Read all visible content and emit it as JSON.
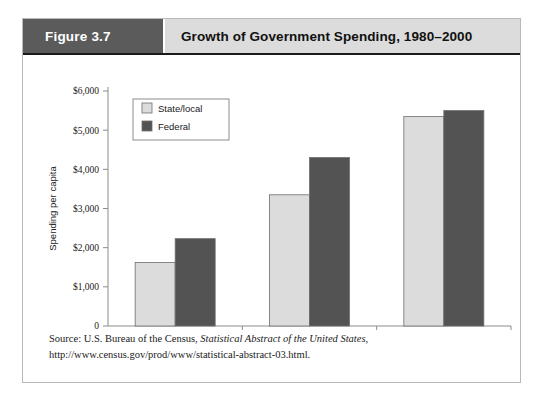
{
  "figure": {
    "badge": "Figure 3.7",
    "title": "Growth of Government Spending, 1980–2000"
  },
  "source": {
    "prefix": "Source: U.S. Bureau of the Census, ",
    "italic": "Statistical Abstract of the United States",
    "suffix": ", http://www.census.gov/prod/www/statistical-abstract-03.html."
  },
  "colors": {
    "state_local": "#dcdcdc",
    "federal": "#535353",
    "badge_bg": "#5b5b5b",
    "title_bg": "#dcdcdc",
    "axis": "#8c8c8c",
    "bar_outline": "#6e6e6e",
    "frame": "#b9b9b9"
  },
  "chart_data": {
    "type": "bar",
    "title": "Growth of Government Spending, 1980–2000",
    "xlabel": "",
    "ylabel": "Spending per capita",
    "categories": [
      "1980",
      "1990",
      "2000"
    ],
    "series": [
      {
        "name": "State/local",
        "values": [
          1620,
          3350,
          5350
        ],
        "color": "#dcdcdc"
      },
      {
        "name": "Federal",
        "values": [
          2230,
          4300,
          5500
        ],
        "color": "#535353"
      }
    ],
    "ylim": [
      0,
      6000
    ],
    "yticks": [
      0,
      1000,
      2000,
      3000,
      4000,
      5000,
      6000
    ],
    "ytick_labels": [
      "0",
      "$1,000",
      "$2,000",
      "$3,000",
      "$4,000",
      "$5,000",
      "$6,000"
    ],
    "grid": false,
    "legend_position": "upper left"
  }
}
